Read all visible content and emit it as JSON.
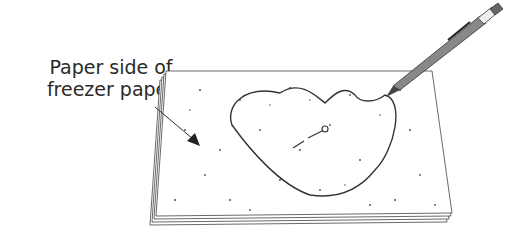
{
  "diagram": {
    "label_lines": [
      "Paper side of",
      "freezer paper"
    ],
    "elements": [
      "stack-of-freezer-paper-sheets",
      "heart-shaped-template-outline",
      "mechanical-pencil",
      "pointer-arrow",
      "center-marking-line"
    ],
    "colors": {
      "line": "#333333",
      "pencil": "#777777",
      "paper": "#ffffff",
      "speckle": "#555555"
    }
  }
}
